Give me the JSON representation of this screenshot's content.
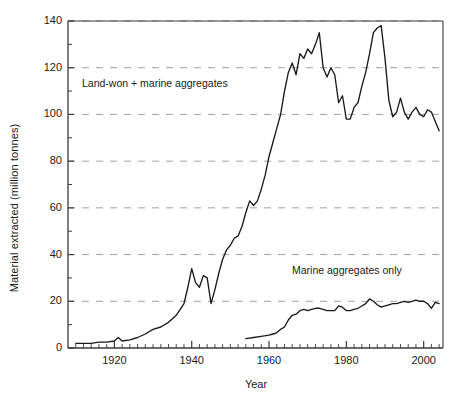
{
  "chart_data": {
    "type": "line",
    "title": "",
    "xlabel": "Year",
    "ylabel": "Material extracted (million tonnes)",
    "xlim": [
      1908,
      2005
    ],
    "ylim": [
      0,
      140
    ],
    "yticks": [
      0,
      20,
      40,
      60,
      80,
      100,
      120,
      140
    ],
    "xticks": [
      1920,
      1940,
      1960,
      1980,
      2000
    ],
    "grid": "horizontal-dashed",
    "legend_position": "inline-annotations",
    "annotations": [
      {
        "text": "Land-won + marine aggregates",
        "x": 1922,
        "y": 113
      },
      {
        "text": "Marine aggregates only",
        "x": 1971,
        "y": 31
      }
    ],
    "series": [
      {
        "name": "Land-won + marine aggregates",
        "x": [
          1910,
          1912,
          1914,
          1916,
          1918,
          1920,
          1921,
          1922,
          1924,
          1926,
          1928,
          1930,
          1932,
          1934,
          1936,
          1938,
          1939,
          1940,
          1941,
          1942,
          1943,
          1944,
          1945,
          1946,
          1947,
          1948,
          1949,
          1950,
          1951,
          1952,
          1953,
          1954,
          1955,
          1956,
          1957,
          1958,
          1959,
          1960,
          1961,
          1962,
          1963,
          1964,
          1965,
          1966,
          1967,
          1968,
          1969,
          1970,
          1971,
          1972,
          1973,
          1974,
          1975,
          1976,
          1977,
          1978,
          1979,
          1980,
          1981,
          1982,
          1983,
          1984,
          1985,
          1986,
          1987,
          1988,
          1989,
          1990,
          1991,
          1992,
          1993,
          1994,
          1995,
          1996,
          1997,
          1998,
          1999,
          2000,
          2001,
          2002,
          2003,
          2004
        ],
        "values": [
          2,
          2,
          2,
          2.5,
          2.5,
          3,
          4.5,
          3,
          3.5,
          4.5,
          6,
          8,
          9,
          11,
          14,
          19,
          26,
          34,
          28,
          26,
          31,
          30,
          19,
          25,
          32,
          38,
          42,
          44,
          47,
          48,
          52,
          58,
          63,
          61,
          63,
          68,
          74,
          82,
          88,
          94,
          100,
          110,
          118,
          122,
          117,
          126,
          124,
          128,
          126,
          130,
          135,
          120,
          116,
          120,
          117,
          105,
          108,
          98,
          98,
          103,
          105,
          112,
          118,
          126,
          135,
          137,
          138,
          124,
          106,
          99,
          101,
          107,
          101,
          98,
          101,
          103,
          100,
          99,
          102,
          101,
          97,
          93
        ]
      },
      {
        "name": "Marine aggregates only",
        "x": [
          1954,
          1956,
          1958,
          1960,
          1961,
          1962,
          1963,
          1964,
          1965,
          1966,
          1967,
          1968,
          1969,
          1970,
          1971,
          1972,
          1973,
          1974,
          1975,
          1976,
          1977,
          1978,
          1979,
          1980,
          1981,
          1982,
          1983,
          1984,
          1985,
          1986,
          1987,
          1988,
          1989,
          1990,
          1991,
          1992,
          1993,
          1994,
          1995,
          1996,
          1997,
          1998,
          1999,
          2000,
          2001,
          2002,
          2003,
          2004
        ],
        "values": [
          4,
          4.5,
          5,
          5.5,
          6,
          6.5,
          8,
          9,
          12,
          14,
          14.5,
          16,
          16.5,
          16,
          16.5,
          17,
          17,
          16.5,
          16,
          16,
          16,
          18,
          17.5,
          16,
          16,
          16.5,
          17,
          18,
          19,
          21,
          20,
          18.5,
          17.5,
          18,
          18.5,
          19,
          19,
          19.5,
          20,
          19.5,
          20,
          20.5,
          20,
          20,
          19,
          17,
          19.5,
          19
        ]
      }
    ]
  },
  "axis": {
    "y_label": "Material extracted (million tonnes)",
    "x_label": "Year",
    "y_ticks": [
      "0",
      "20",
      "40",
      "60",
      "80",
      "100",
      "120",
      "140"
    ],
    "x_ticks": [
      "1920",
      "1940",
      "1960",
      "1980",
      "2000"
    ]
  },
  "annotations": {
    "land": "Land-won + marine aggregates",
    "marine": "Marine aggregates only"
  },
  "colors": {
    "line": "#1a1a1a",
    "grid": "#9aa3ad",
    "axis": "#3a3a3a",
    "background": "#ffffff"
  }
}
